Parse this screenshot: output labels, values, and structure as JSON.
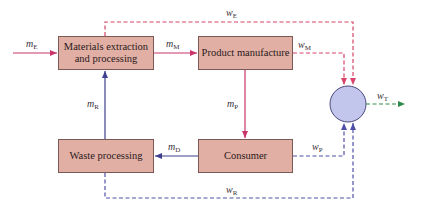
{
  "diagram": {
    "type": "material-flow-diagram",
    "boxes": {
      "extraction": {
        "line1": "Materials extraction",
        "line2": "and processing"
      },
      "manufacture": {
        "label": "Product manufacture"
      },
      "waste": {
        "label": "Waste processing"
      },
      "consumer": {
        "label": "Consumer"
      }
    },
    "flows": {
      "mE": {
        "base": "m",
        "sub": "E",
        "kind": "material"
      },
      "mM": {
        "base": "m",
        "sub": "M",
        "kind": "material"
      },
      "mP": {
        "base": "m",
        "sub": "P",
        "kind": "material"
      },
      "mD": {
        "base": "m",
        "sub": "D",
        "kind": "material"
      },
      "mR": {
        "base": "m",
        "sub": "R",
        "kind": "material"
      },
      "wE": {
        "base": "w",
        "sub": "E",
        "kind": "waste"
      },
      "wM": {
        "base": "w",
        "sub": "M",
        "kind": "waste"
      },
      "wP": {
        "base": "w",
        "sub": "P",
        "kind": "waste"
      },
      "wR": {
        "base": "w",
        "sub": "R",
        "kind": "waste"
      },
      "wT": {
        "base": "w",
        "sub": "T",
        "kind": "total-waste"
      }
    },
    "colors": {
      "box_fill": "#e2afa5",
      "box_border": "#7a5a55",
      "forward_flow": "#c8356a",
      "return_flow": "#3f3f8f",
      "waste_red_dashed": "#d8446a",
      "waste_blue_dashed": "#5050a8",
      "total_waste": "#2e8a4a",
      "circle_fill": "#c3c6ec",
      "circle_border": "#4a4a7a"
    }
  }
}
